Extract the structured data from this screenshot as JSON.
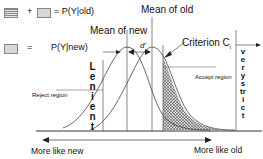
{
  "legend": {
    "plus": "+",
    "eq1": "= P(Y|old)",
    "eq2": "=",
    "eq2_text": "P(Y|new)"
  },
  "labels": {
    "mean_of_old": "Mean of old",
    "mean_of_new": "Mean of new",
    "d_prime": "d'",
    "criterion": "Criterion C",
    "criterion_sub": "i",
    "accept_region": "Accept region",
    "reject_region": "Reject region",
    "lenient": "Lenient",
    "very_strict": "verystrict",
    "more_like_new": "More like new",
    "more_like_old": "More like old"
  },
  "colors": {
    "line": "#333333",
    "shade": "#bdbdbd",
    "hatch": "#555555"
  }
}
